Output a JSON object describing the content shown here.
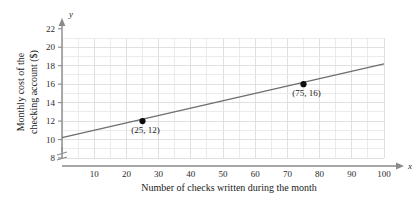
{
  "chart_data": {
    "type": "line",
    "title": "",
    "xlabel": "Number of checks written during the month",
    "ylabel_line1": "Monthly cost of the",
    "ylabel_line2": "checking account ($)",
    "x_axis_symbol": "x",
    "y_axis_symbol": "y",
    "xlim": [
      0,
      100
    ],
    "ylim": [
      8,
      21
    ],
    "grid": true,
    "grid_step_x": 5,
    "grid_step_y": 1,
    "y_axis_break": true,
    "legend": "none",
    "xticks": [
      10,
      20,
      30,
      40,
      50,
      60,
      70,
      80,
      90,
      100
    ],
    "xtick_labels": [
      "10",
      "20",
      "30",
      "40",
      "50",
      "60",
      "70",
      "80",
      "90",
      "100"
    ],
    "yticks": [
      8,
      10,
      12,
      14,
      16,
      18,
      20,
      22
    ],
    "ytick_labels": [
      "8",
      "10",
      "12",
      "14",
      "16",
      "18",
      "20",
      "22"
    ],
    "series": [
      {
        "name": "monthly cost line",
        "x": [
          0,
          100
        ],
        "y": [
          10.2,
          18.2
        ],
        "slope": 0.08,
        "intercept": 10.0
      }
    ],
    "points": [
      {
        "x": 25,
        "y": 12,
        "label": "(25, 12)"
      },
      {
        "x": 75,
        "y": 16,
        "label": "(75, 16)"
      }
    ],
    "colors": {
      "line": "#6e6e6e",
      "point": "#0d0d0d",
      "grid": "#e6e6e6",
      "axis": "#8a8a8a",
      "background": "#ffffff"
    }
  }
}
